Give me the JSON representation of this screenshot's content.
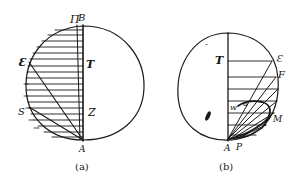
{
  "figures": [
    {
      "id": "a",
      "caption": "(a)",
      "labels": {
        "top_left": "Π",
        "top_right": "B",
        "left_upper": "Ɛ",
        "right_upper": "T",
        "left_lower": "S",
        "right_lower": "Z",
        "bottom": "A"
      }
    },
    {
      "id": "b",
      "caption": "(b)",
      "labels": {
        "marks": "″",
        "T": "T",
        "E": "Ɛ",
        "F": "F",
        "w": "w",
        "a": "a",
        "M": "M",
        "A": "A",
        "P": "P"
      }
    }
  ],
  "colors": {
    "ink": "#1a1a1a",
    "background": "#ffffff"
  }
}
